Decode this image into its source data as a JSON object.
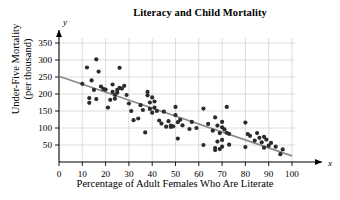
{
  "chart_data": {
    "type": "scatter",
    "title": "Literacy and Child Mortality",
    "xlabel": "Percentage of Adult Females Who Are Literate",
    "ylabel": "Under-Five Mortality\n(per thousand)",
    "x_axis_letter": "x",
    "y_axis_letter": "y",
    "xlim": [
      0,
      100
    ],
    "ylim": [
      0,
      360
    ],
    "xticks": [
      0,
      10,
      20,
      30,
      40,
      50,
      60,
      70,
      80,
      90,
      100
    ],
    "yticks": [
      50,
      100,
      150,
      200,
      250,
      300,
      350
    ],
    "grid": true,
    "grid_color": "#b9b9b9",
    "point_color": "#2b2b2b",
    "line_color": "#8c8c8c",
    "trendline": {
      "name": "least-squares regression line",
      "x_start": 0,
      "y_start": 252,
      "x_end": 100,
      "y_end": 18
    },
    "series": [
      {
        "name": "Countries",
        "points": [
          [
            10,
            230
          ],
          [
            12,
            278
          ],
          [
            13,
            174
          ],
          [
            13,
            188
          ],
          [
            14,
            240
          ],
          [
            15,
            212
          ],
          [
            16,
            185
          ],
          [
            16,
            302
          ],
          [
            17,
            266
          ],
          [
            18,
            222
          ],
          [
            19,
            215
          ],
          [
            20,
            213
          ],
          [
            21,
            160
          ],
          [
            22,
            183
          ],
          [
            23,
            228
          ],
          [
            23,
            206
          ],
          [
            24,
            197
          ],
          [
            24,
            186
          ],
          [
            25,
            204
          ],
          [
            25,
            212
          ],
          [
            26,
            218
          ],
          [
            26,
            277
          ],
          [
            27,
            216
          ],
          [
            28,
            224
          ],
          [
            29,
            197
          ],
          [
            30,
            172
          ],
          [
            31,
            150
          ],
          [
            32,
            123
          ],
          [
            34,
            128
          ],
          [
            35,
            167
          ],
          [
            36,
            153
          ],
          [
            37,
            87
          ],
          [
            38,
            196
          ],
          [
            38,
            206
          ],
          [
            39,
            175
          ],
          [
            39,
            156
          ],
          [
            40,
            145
          ],
          [
            40,
            190
          ],
          [
            41,
            160
          ],
          [
            41,
            178
          ],
          [
            42,
            150
          ],
          [
            43,
            122
          ],
          [
            44,
            113
          ],
          [
            45,
            148
          ],
          [
            46,
            104
          ],
          [
            47,
            120
          ],
          [
            48,
            107
          ],
          [
            48,
            103
          ],
          [
            49,
            105
          ],
          [
            50,
            162
          ],
          [
            50,
            138
          ],
          [
            51,
            117
          ],
          [
            51,
            69
          ],
          [
            52,
            124
          ],
          [
            53,
            108
          ],
          [
            56,
            97
          ],
          [
            57,
            118
          ],
          [
            59,
            100
          ],
          [
            62,
            157
          ],
          [
            62,
            50
          ],
          [
            64,
            112
          ],
          [
            66,
            92
          ],
          [
            67,
            131
          ],
          [
            67,
            35
          ],
          [
            67,
            41
          ],
          [
            68,
            107
          ],
          [
            68,
            60
          ],
          [
            69,
            85
          ],
          [
            69,
            38
          ],
          [
            70,
            118
          ],
          [
            70,
            102
          ],
          [
            70,
            65
          ],
          [
            70,
            45
          ],
          [
            71,
            96
          ],
          [
            72,
            162
          ],
          [
            72,
            86
          ],
          [
            73,
            51
          ],
          [
            73,
            83
          ],
          [
            80,
            116
          ],
          [
            80,
            44
          ],
          [
            81,
            82
          ],
          [
            82,
            77
          ],
          [
            84,
            63
          ],
          [
            85,
            85
          ],
          [
            86,
            71
          ],
          [
            87,
            58
          ],
          [
            88,
            74
          ],
          [
            88,
            42
          ],
          [
            89,
            66
          ],
          [
            90,
            48
          ],
          [
            91,
            56
          ],
          [
            93,
            45
          ],
          [
            95,
            23
          ],
          [
            96,
            37
          ]
        ]
      }
    ]
  }
}
